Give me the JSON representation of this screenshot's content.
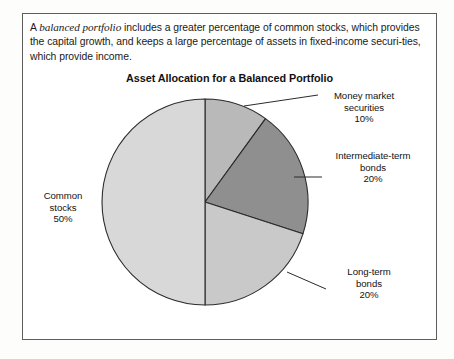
{
  "intro": {
    "lead": "A ",
    "term": "balanced portfolio",
    "body": " includes a greater percentage of common stocks, which provides the capital growth, and keeps a large percentage of assets in fixed-income securi-ties, which provide income."
  },
  "chart_data": {
    "type": "pie",
    "title": "Asset Allocation for a Balanced Portfolio",
    "xlabel": "",
    "ylabel": "",
    "start_angle_deg": 0,
    "direction": "clockwise",
    "legend_position": "callout-labels",
    "grid": false,
    "categories": [
      "Money market securities",
      "Intermediate-term bonds",
      "Long-term bonds",
      "Common stocks"
    ],
    "values": [
      10,
      20,
      20,
      50
    ],
    "unit": "%",
    "slices": [
      {
        "name": "Money market securities",
        "label_line1": "Money market",
        "label_line2": "securities",
        "value": 10,
        "value_label": "10%",
        "color": "#b9b9b9",
        "start_deg": 0,
        "end_deg": 36
      },
      {
        "name": "Intermediate-term bonds",
        "label_line1": "Intermediate-term",
        "label_line2": "bonds",
        "value": 20,
        "value_label": "20%",
        "color": "#8f8f8f",
        "start_deg": 36,
        "end_deg": 108
      },
      {
        "name": "Long-term bonds",
        "label_line1": "Long-term",
        "label_line2": "bonds",
        "value": 20,
        "value_label": "20%",
        "color": "#c9c9c9",
        "start_deg": 108,
        "end_deg": 180
      },
      {
        "name": "Common stocks",
        "label_line1": "Common",
        "label_line2": "stocks",
        "value": 50,
        "value_label": "50%",
        "color": "#d8d8d8",
        "start_deg": 180,
        "end_deg": 360
      }
    ]
  },
  "colors": {
    "frame": "#5d5d5d",
    "outline": "#2b2b2b",
    "text": "#131313",
    "page": "#fdfdfc"
  }
}
